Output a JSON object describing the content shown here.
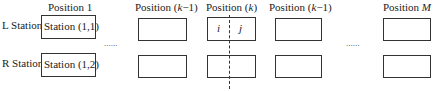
{
  "headers": {
    "pos1": "Position 1",
    "pos_km1_left_prefix": "Position (",
    "pos_km1_left_var": "k",
    "pos_km1_left_suffix": "−1)",
    "pos_k_prefix": "Position (",
    "pos_k_var": "k",
    "pos_k_suffix": ")",
    "pos_km1_right_prefix": "Position (",
    "pos_km1_right_var": "k",
    "pos_km1_right_suffix": "−1)",
    "pos_M_prefix": "Position ",
    "pos_M_var": "M"
  },
  "rows": {
    "left": "L Station",
    "right": "R Station"
  },
  "boxes": {
    "station_1_1": "Station (1,1)",
    "station_1_2": "Station (1,2)",
    "k_left_var": "i",
    "k_right_var": "j"
  },
  "ellipsis": "......"
}
